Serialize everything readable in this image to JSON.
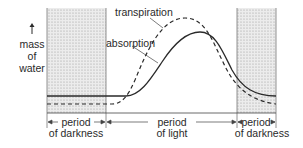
{
  "diagram": {
    "y_axis_label": [
      "mass",
      "of",
      "water"
    ],
    "y_axis_arrow": "up-arrow",
    "curves": [
      {
        "name": "transpiration",
        "style": "dashed"
      },
      {
        "name": "absorption",
        "style": "solid"
      }
    ],
    "periods": [
      {
        "line1": "period",
        "line2": "of darkness",
        "shaded": true
      },
      {
        "line1": "period",
        "line2": "of light",
        "shaded": false
      },
      {
        "line1": "period",
        "line2": "of darkness",
        "shaded": true
      }
    ],
    "colors": {
      "line": "#2a2a2a",
      "shade": "#d9d9d9",
      "background": "#ffffff"
    }
  }
}
